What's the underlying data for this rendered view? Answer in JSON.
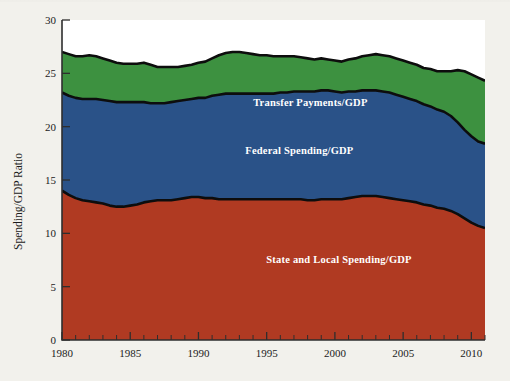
{
  "chart_data": {
    "type": "area",
    "stacked": true,
    "title": "",
    "xlabel": "",
    "ylabel": "Spending/GDP Ratio",
    "xlim": [
      1980,
      2011
    ],
    "ylim": [
      0,
      30
    ],
    "ytick_values": [
      0,
      5,
      10,
      15,
      20,
      25,
      30
    ],
    "ytick_labels": [
      "0",
      "5",
      "10",
      "15",
      "20",
      "25",
      "30"
    ],
    "xtick_values": [
      1980,
      1985,
      1990,
      1995,
      2000,
      2005,
      2010
    ],
    "xtick_labels": [
      "1980",
      "1985",
      "1990",
      "1995",
      "2000",
      "2005",
      "2010"
    ],
    "grid": false,
    "legend_position": "inline-annotations",
    "x": [
      1980,
      1980.5,
      1981,
      1981.5,
      1982,
      1982.5,
      1983,
      1983.5,
      1984,
      1984.5,
      1985,
      1985.5,
      1986,
      1986.5,
      1987,
      1987.5,
      1988,
      1988.5,
      1989,
      1989.5,
      1990,
      1990.5,
      1991,
      1991.5,
      1992,
      1992.5,
      1993,
      1993.5,
      1994,
      1994.5,
      1995,
      1995.5,
      1996,
      1996.5,
      1997,
      1997.5,
      1998,
      1998.5,
      1999,
      1999.5,
      2000,
      2000.5,
      2001,
      2001.5,
      2002,
      2002.5,
      2003,
      2003.5,
      2004,
      2004.5,
      2005,
      2005.5,
      2006,
      2006.5,
      2007,
      2007.5,
      2008,
      2008.5,
      2009,
      2009.5,
      2010,
      2010.5,
      2011
    ],
    "series": [
      {
        "name": "State and Local Spending/GDP",
        "color": "#b03a22",
        "label_position": {
          "x": 2000.3,
          "y": 7.2
        },
        "values": [
          14.0,
          13.6,
          13.3,
          13.1,
          13.0,
          12.9,
          12.8,
          12.6,
          12.5,
          12.5,
          12.6,
          12.7,
          12.9,
          13.0,
          13.1,
          13.1,
          13.1,
          13.2,
          13.3,
          13.4,
          13.4,
          13.3,
          13.3,
          13.2,
          13.2,
          13.2,
          13.2,
          13.2,
          13.2,
          13.2,
          13.2,
          13.2,
          13.2,
          13.2,
          13.2,
          13.2,
          13.1,
          13.1,
          13.2,
          13.2,
          13.2,
          13.2,
          13.3,
          13.4,
          13.5,
          13.5,
          13.5,
          13.4,
          13.3,
          13.2,
          13.1,
          13.0,
          12.9,
          12.7,
          12.6,
          12.4,
          12.3,
          12.1,
          11.8,
          11.4,
          11.0,
          10.7,
          10.5
        ]
      },
      {
        "name": "Federal Spending/GDP",
        "color": "#2a5288",
        "label_position": {
          "x": 1997.4,
          "y": 17.4
        },
        "values": [
          9.2,
          9.3,
          9.4,
          9.5,
          9.6,
          9.7,
          9.7,
          9.8,
          9.8,
          9.8,
          9.7,
          9.6,
          9.4,
          9.2,
          9.1,
          9.1,
          9.2,
          9.2,
          9.2,
          9.2,
          9.3,
          9.4,
          9.6,
          9.8,
          9.9,
          9.9,
          9.9,
          9.9,
          9.9,
          9.9,
          9.9,
          9.9,
          10.0,
          10.0,
          10.1,
          10.1,
          10.2,
          10.2,
          10.2,
          10.2,
          10.1,
          10.0,
          10.0,
          9.9,
          9.9,
          9.9,
          9.9,
          9.9,
          9.9,
          9.8,
          9.7,
          9.6,
          9.5,
          9.4,
          9.3,
          9.2,
          9.1,
          8.9,
          8.6,
          8.3,
          8.1,
          7.9,
          7.9
        ]
      },
      {
        "name": "Transfer Payments/GDP",
        "color": "#3d9140",
        "label_position": {
          "x": 1998.2,
          "y": 21.9
        },
        "values": [
          3.8,
          3.9,
          3.9,
          4.0,
          4.1,
          4.0,
          3.9,
          3.8,
          3.7,
          3.6,
          3.6,
          3.6,
          3.7,
          3.6,
          3.4,
          3.4,
          3.3,
          3.2,
          3.2,
          3.2,
          3.3,
          3.4,
          3.5,
          3.7,
          3.8,
          3.9,
          3.9,
          3.8,
          3.7,
          3.6,
          3.6,
          3.5,
          3.4,
          3.4,
          3.3,
          3.2,
          3.1,
          3.0,
          3.0,
          2.9,
          2.9,
          2.9,
          3.0,
          3.1,
          3.2,
          3.3,
          3.4,
          3.4,
          3.4,
          3.4,
          3.4,
          3.4,
          3.4,
          3.4,
          3.5,
          3.6,
          3.8,
          4.2,
          4.9,
          5.5,
          5.8,
          6.0,
          5.9
        ]
      }
    ],
    "totals_note": "Top boundary = sum of all three series (total spending/GDP), ranges ~27.0 in 1980 to ~26.3 in 2011"
  },
  "labels": {
    "ylabel": "Spending/GDP Ratio",
    "transfer": "Transfer Payments/GDP",
    "federal": "Federal Spending/GDP",
    "state_local": "State and Local Spending/GDP"
  },
  "colors": {
    "red": "#b03a22",
    "blue": "#2a5288",
    "green": "#3d9140",
    "outline": "#0d0d0d",
    "page": "#f2f1ec",
    "axis": "#2e2e2e"
  }
}
